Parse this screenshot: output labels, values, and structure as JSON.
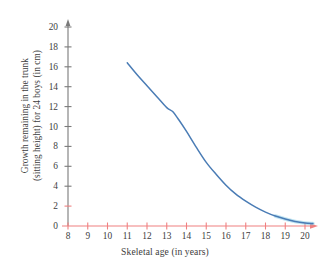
{
  "chart_data": {
    "type": "line",
    "title": "",
    "xlabel": "Skeletal age (in years)",
    "ylabel_line1": "Growth remaining in the trunk",
    "ylabel_line2": "(sitting height) for 24 boys (in cm)",
    "xlim": [
      8,
      20.5
    ],
    "ylim": [
      0,
      20.6
    ],
    "xticks": [
      8,
      9,
      10,
      11,
      12,
      13,
      14,
      15,
      16,
      17,
      18,
      19,
      20
    ],
    "yticks": [
      0,
      2,
      4,
      6,
      8,
      10,
      12,
      14,
      16,
      18,
      20
    ],
    "grid": false,
    "legend": "none",
    "axis_color_x": "#f08080",
    "axis_color_y": "#7a7a7a",
    "series": [
      {
        "name": "Growth remaining",
        "color": "#4a7cb5",
        "x": [
          11.0,
          11.5,
          12.0,
          12.5,
          13.0,
          13.3,
          13.6,
          14.0,
          14.5,
          15.0,
          15.5,
          16.0,
          16.5,
          17.0,
          17.5,
          18.0,
          18.5,
          19.0,
          19.5,
          20.0,
          20.4
        ],
        "y": [
          16.4,
          15.2,
          14.1,
          13.0,
          11.9,
          11.5,
          10.7,
          9.5,
          7.9,
          6.4,
          5.2,
          4.1,
          3.2,
          2.5,
          1.9,
          1.4,
          1.0,
          0.7,
          0.45,
          0.3,
          0.25
        ]
      }
    ]
  }
}
